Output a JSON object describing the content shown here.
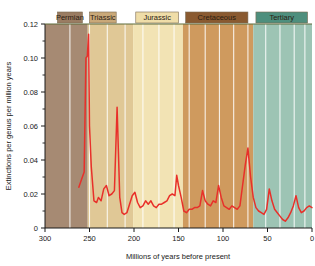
{
  "chart_data": {
    "type": "line",
    "title": "",
    "xlabel": "Millions of years before present",
    "ylabel": "Extinctions per genus per million years",
    "xlim": [
      300,
      0
    ],
    "ylim": [
      0,
      0.12
    ],
    "x_ticks": [
      300,
      250,
      200,
      150,
      100,
      50,
      0
    ],
    "x_tick_labels": [
      "300",
      "250",
      "200",
      "150",
      "100",
      "50",
      "0"
    ],
    "x_minor_step": 10,
    "y_ticks": [
      0,
      0.02,
      0.04,
      0.06,
      0.08,
      0.1,
      0.12
    ],
    "y_tick_labels": [
      "0",
      "0.02",
      "0.04",
      "0.06",
      "0.08",
      "0.10",
      "0.12"
    ],
    "y_minor_step": 0.01,
    "grid": false,
    "legend": "none",
    "line_color": "#e8302a",
    "series": [
      {
        "name": "Extinction rate",
        "x": [
          262,
          258,
          256,
          254,
          252.5,
          251,
          250,
          248,
          245,
          242,
          240,
          237,
          234,
          231,
          228,
          225,
          222,
          219,
          216,
          213.5,
          211,
          208,
          205,
          202,
          199,
          196,
          193,
          190,
          187,
          184,
          181,
          178,
          175,
          172,
          169,
          166,
          163,
          160,
          157,
          154,
          152,
          150,
          147,
          144,
          141,
          138,
          135,
          132,
          129,
          126,
          123,
          120,
          117,
          114,
          111,
          108,
          105,
          102,
          99,
          96,
          93,
          90,
          87,
          84,
          81,
          78,
          75,
          72,
          69,
          66,
          63,
          60,
          57,
          54,
          51,
          48,
          45,
          42,
          39,
          36,
          33,
          30,
          27,
          24,
          21,
          18,
          15,
          12,
          9,
          6,
          3,
          0
        ],
        "y": [
          0.024,
          0.03,
          0.033,
          0.1,
          0.101,
          0.114,
          0.06,
          0.036,
          0.016,
          0.015,
          0.018,
          0.016,
          0.023,
          0.025,
          0.019,
          0.02,
          0.022,
          0.071,
          0.018,
          0.009,
          0.008,
          0.009,
          0.014,
          0.019,
          0.021,
          0.015,
          0.012,
          0.013,
          0.016,
          0.014,
          0.016,
          0.013,
          0.012,
          0.014,
          0.014,
          0.015,
          0.016,
          0.019,
          0.02,
          0.019,
          0.031,
          0.025,
          0.018,
          0.01,
          0.009,
          0.011,
          0.011,
          0.012,
          0.012,
          0.013,
          0.022,
          0.016,
          0.014,
          0.013,
          0.016,
          0.015,
          0.025,
          0.018,
          0.013,
          0.012,
          0.011,
          0.013,
          0.012,
          0.011,
          0.013,
          0.025,
          0.037,
          0.047,
          0.03,
          0.018,
          0.012,
          0.01,
          0.009,
          0.008,
          0.011,
          0.023,
          0.016,
          0.011,
          0.009,
          0.007,
          0.005,
          0.004,
          0.006,
          0.009,
          0.013,
          0.019,
          0.012,
          0.009,
          0.01,
          0.012,
          0.013,
          0.012
        ]
      }
    ],
    "bands": [
      {
        "label": "Permian",
        "start": 300,
        "end": 252,
        "color": "#a68a73",
        "label_box_color": "#9a7c62",
        "label_start": 286,
        "label_end": 258
      },
      {
        "label": "Triassic",
        "start": 252,
        "end": 201,
        "color": "#e0c896",
        "label_box_color": "#c9a878",
        "label_start": 250,
        "label_end": 220
      },
      {
        "label": "Jurassic",
        "start": 201,
        "end": 145,
        "color": "#f2e3b4",
        "label_box_color": "#efdda8",
        "label_start": 198,
        "label_end": 150
      },
      {
        "label": "Cretaceous",
        "start": 145,
        "end": 66,
        "color": "#cf9a5e",
        "label_box_color": "#8a5a30",
        "label_start": 142,
        "label_end": 72
      },
      {
        "label": "Tertiary",
        "start": 66,
        "end": 0,
        "color": "#9dc4b4",
        "label_box_color": "#4e8f7d",
        "label_start": 63,
        "label_end": 5
      }
    ],
    "band_gridlines": [
      272,
      250,
      230,
      210,
      190,
      172,
      155,
      138,
      120,
      104,
      88,
      72,
      52,
      36,
      20,
      8
    ]
  }
}
